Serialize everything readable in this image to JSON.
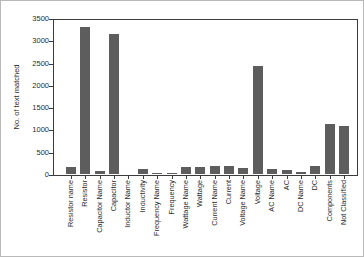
{
  "figure": {
    "background": "#ffffff",
    "border_color": "#b9b9b9"
  },
  "chart_data": {
    "type": "bar",
    "title": "",
    "xlabel": "",
    "ylabel": "No. of text matched",
    "ylim": [
      0,
      3500
    ],
    "yticks": [
      0,
      500,
      1000,
      1500,
      2000,
      2500,
      3000,
      3500
    ],
    "grid": false,
    "legend": false,
    "bar_color": "#5d5d5d",
    "axis_color": "#3c3c3c",
    "categories": [
      "Resistor name",
      "Resistor",
      "Capacitor Name",
      "Capacitor",
      "Inductor Name",
      "Inductivity",
      "Frequency Name",
      "Frequency",
      "Wattage Name",
      "Wattage",
      "Current Name",
      "Current",
      "Voltage Name",
      "Voltage",
      "AC Name",
      "AC",
      "DC Name",
      "DC",
      "Components",
      "Not Classified"
    ],
    "values": [
      150,
      3300,
      60,
      3150,
      10,
      120,
      25,
      30,
      150,
      160,
      190,
      170,
      140,
      2430,
      110,
      90,
      50,
      170,
      1120,
      1080
    ]
  }
}
